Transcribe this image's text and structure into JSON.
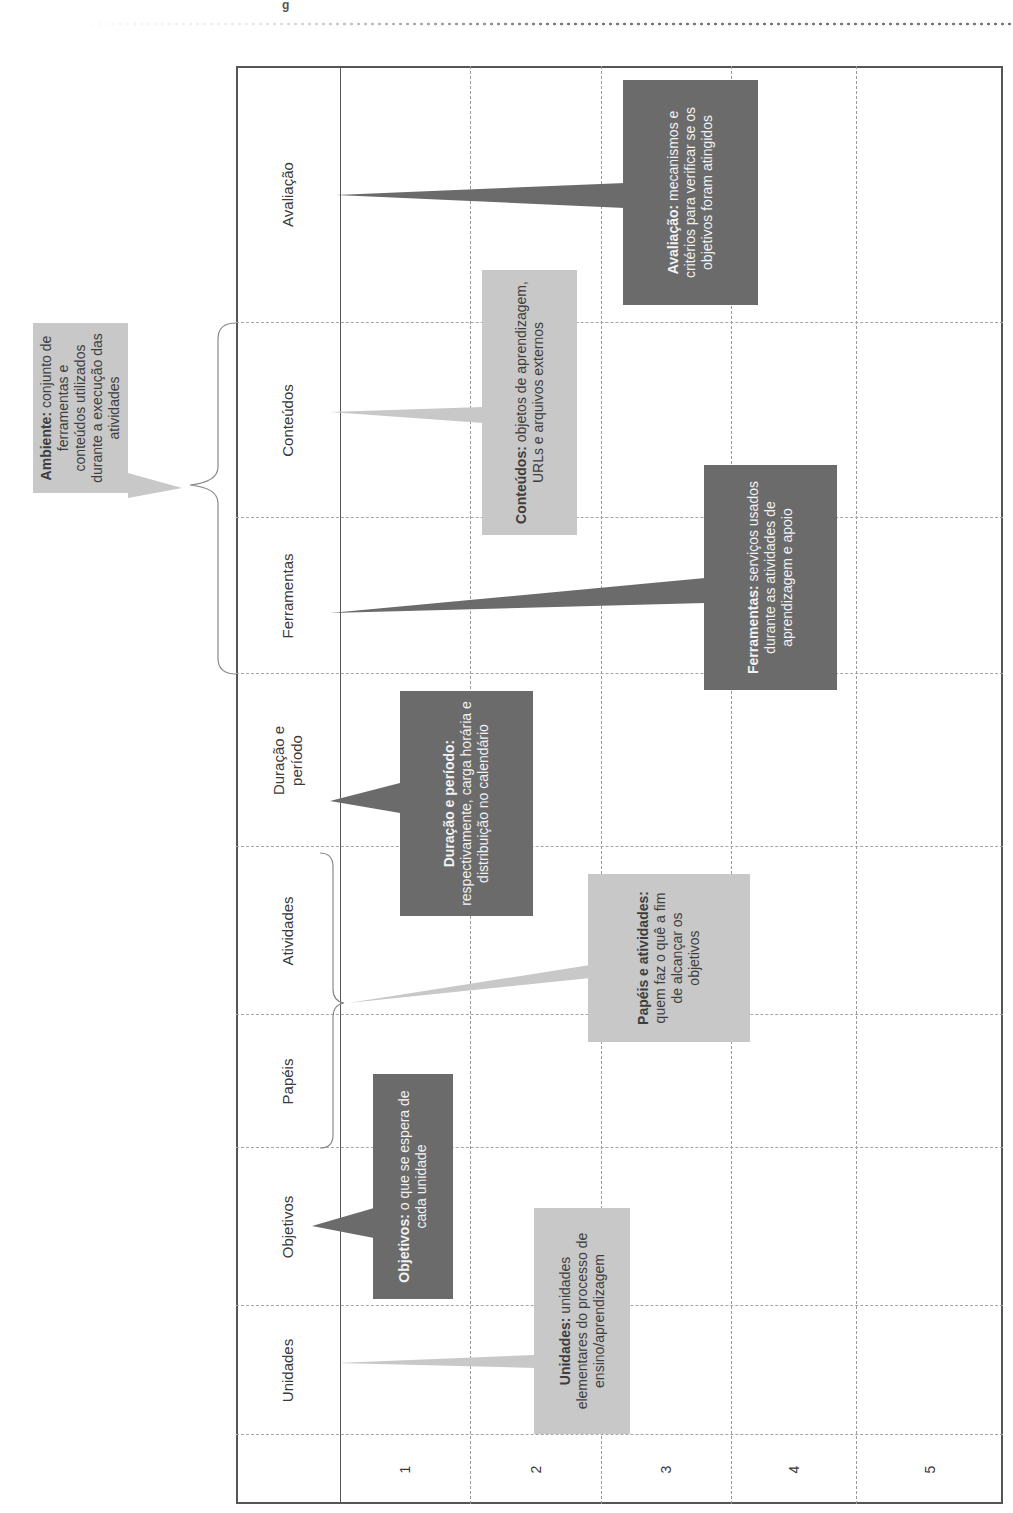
{
  "page": {
    "header_mark": "g",
    "orientation": "rotated 90° counter-clockwise"
  },
  "table": {
    "columns": [
      {
        "id": "blank",
        "label": ""
      },
      {
        "id": "unidades",
        "label": "Unidades"
      },
      {
        "id": "objetivos",
        "label": "Objetivos"
      },
      {
        "id": "papeis",
        "label": "Papéis"
      },
      {
        "id": "atividades",
        "label": "Atividades"
      },
      {
        "id": "duracao",
        "label": "Duração e período"
      },
      {
        "id": "ferramentas",
        "label": "Ferramentas"
      },
      {
        "id": "conteudos",
        "label": "Conteúdos"
      },
      {
        "id": "avaliacao",
        "label": "Avaliação"
      }
    ],
    "rows": [
      "1",
      "2",
      "3",
      "4",
      "5"
    ]
  },
  "callouts": {
    "ambiente": {
      "term": "Ambiente:",
      "text": " conjunto de ferramentas e conteúdos utilizados durante a execução das atividades",
      "style": "light"
    },
    "avaliacao": {
      "term": "Avaliação:",
      "text": " mecanismos e critérios para verificar se os objetivos foram atingidos",
      "style": "dark"
    },
    "conteudos": {
      "term": "Conteúdos:",
      "text": " objetos de aprendizagem, URLs e arquivos externos",
      "style": "light"
    },
    "ferramentas": {
      "term": "Ferramentas:",
      "text": " serviços usados durante as atividades de aprendizagem e apoio",
      "style": "dark"
    },
    "duracao": {
      "term": "Duração e período:",
      "text": " respectivamente, carga horária e distribuição no calendário",
      "style": "dark"
    },
    "papeis_atividades": {
      "term": "Papéis e atividades:",
      "text": " quem faz o quê a fim de alcançar os objetivos",
      "style": "light"
    },
    "objetivos": {
      "term": "Objetivos:",
      "text": " o que se espera de cada unidade",
      "style": "dark"
    },
    "unidades": {
      "term": "Unidades:",
      "text": " unidades elementares do processo de ensino/aprendizagem",
      "style": "light"
    }
  },
  "colors": {
    "dark_callout": "#6b6b6b",
    "light_callout": "#c8c8c8",
    "border": "#555555",
    "grid": "#a5a5a5"
  }
}
